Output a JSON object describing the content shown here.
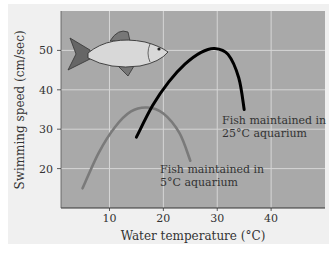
{
  "chart_data": {
    "type": "line",
    "title": "",
    "xlabel": "Water temperature (°C)",
    "ylabel": "Swimming speed (cm/sec)",
    "xticks": [
      10,
      20,
      30,
      40
    ],
    "yticks": [
      20,
      30,
      40,
      50
    ],
    "xlim": [
      1,
      50
    ],
    "ylim": [
      10,
      60
    ],
    "grid": true,
    "colors": {
      "plot_bg": "#a9a9a9",
      "page_bg": "#f0f0f0",
      "grid": "#d6d6d6",
      "warm_series": "#000000",
      "cold_series": "#7a7a7a"
    },
    "series": [
      {
        "name": "Fish maintained in 5°C aquarium",
        "label_lines": [
          "Fish maintained in",
          "5°C aquarium"
        ],
        "color": "#7a7a7a",
        "x": [
          5,
          8,
          11,
          14,
          17,
          20,
          23,
          25
        ],
        "y": [
          15,
          24,
          30.5,
          34.5,
          35.5,
          34,
          29,
          22
        ]
      },
      {
        "name": "Fish maintained in 25°C aquarium",
        "label_lines": [
          "Fish maintained in",
          "25°C aquarium"
        ],
        "color": "#000000",
        "x": [
          15,
          18,
          21,
          24,
          27,
          29.5,
          32,
          34,
          35
        ],
        "y": [
          28,
          36,
          42,
          46.5,
          49.5,
          50.5,
          49,
          43,
          35
        ]
      }
    ],
    "annotations": [
      {
        "type": "illustration",
        "subject": "fish"
      }
    ]
  }
}
